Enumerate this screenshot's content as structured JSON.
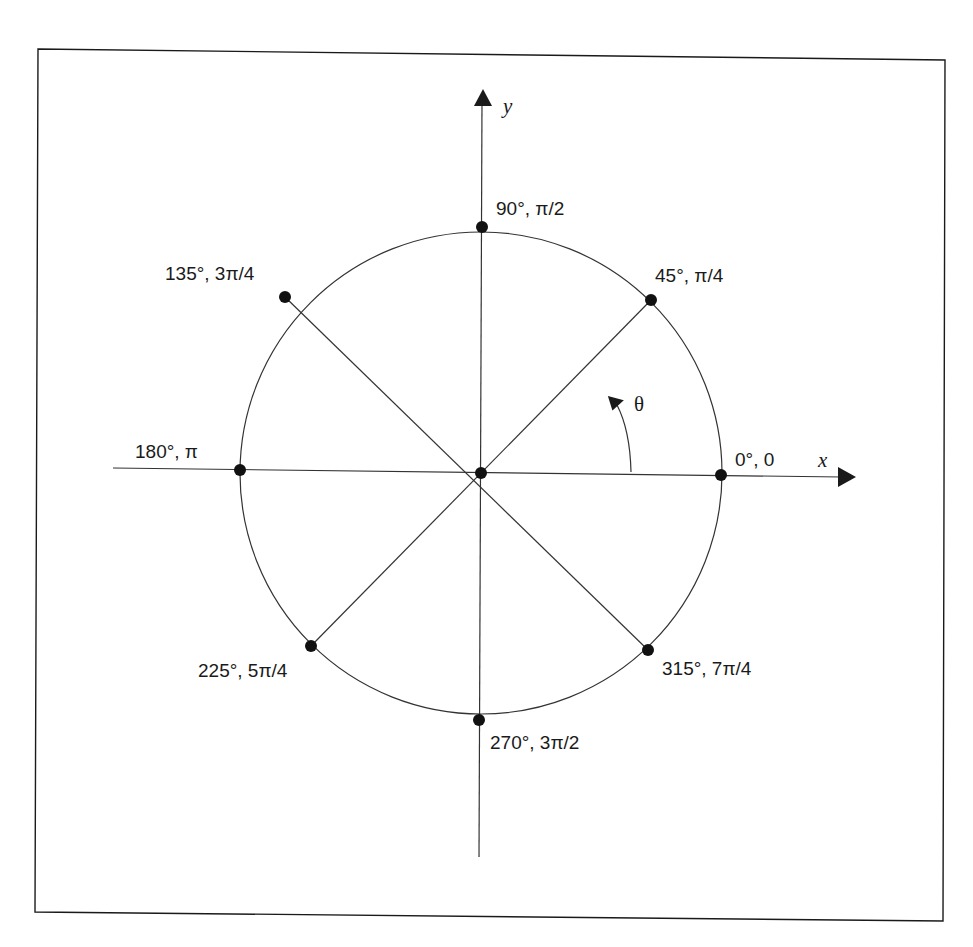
{
  "diagram": {
    "axes": {
      "x_label": "x",
      "y_label": "y",
      "theta_label": "θ"
    },
    "points": [
      {
        "angle_deg": "0°",
        "angle_rad": "0",
        "label": "0°, 0"
      },
      {
        "angle_deg": "45°",
        "angle_rad": "π/4",
        "label": "45°, π/4"
      },
      {
        "angle_deg": "90°",
        "angle_rad": "π/2",
        "label": "90°, π/2"
      },
      {
        "angle_deg": "135°",
        "angle_rad": "3π/4",
        "label": "135°, 3π/4"
      },
      {
        "angle_deg": "180°",
        "angle_rad": "π",
        "label": "180°, π"
      },
      {
        "angle_deg": "225°",
        "angle_rad": "5π/4",
        "label": "225°, 5π/4"
      },
      {
        "angle_deg": "270°",
        "angle_rad": "3π/2",
        "label": "270°, 3π/2"
      },
      {
        "angle_deg": "315°",
        "angle_rad": "7π/4",
        "label": "315°, 7π/4"
      }
    ],
    "colors": {
      "stroke": "#1a1a1a",
      "background": "#ffffff"
    }
  }
}
